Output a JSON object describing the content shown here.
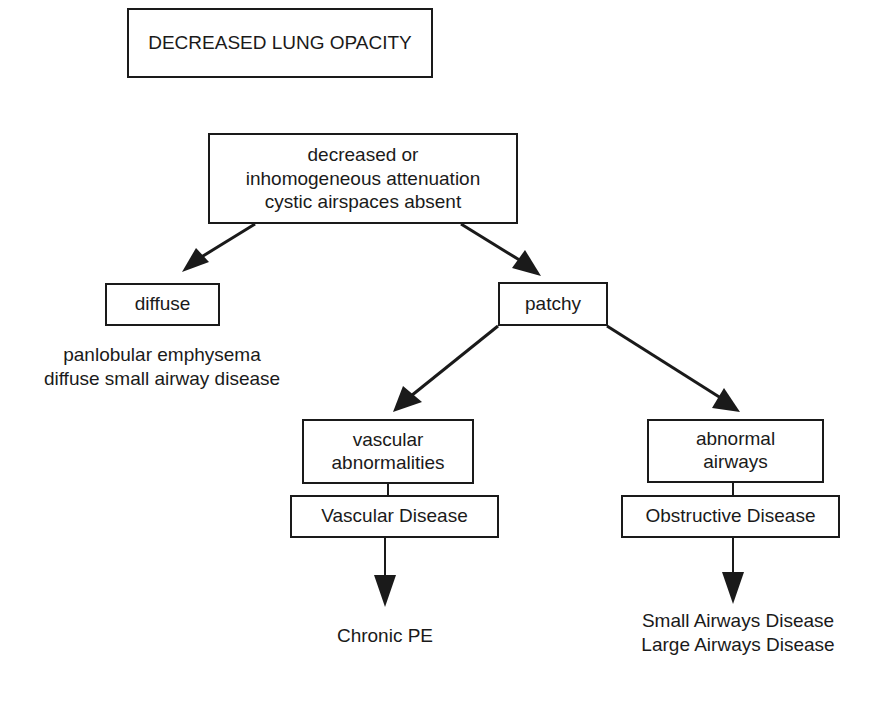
{
  "diagram": {
    "title": "DECREASED LUNG OPACITY",
    "root": {
      "lines": [
        "decreased or",
        "inhomogeneous attenuation",
        "cystic airspaces  absent"
      ]
    },
    "left_branch": {
      "label": "diffuse",
      "findings": [
        "panlobular emphysema",
        "diffuse small airway disease"
      ]
    },
    "right_branch": {
      "label": "patchy",
      "children": [
        {
          "lines": [
            "vascular",
            "abnormalities"
          ],
          "category": "Vascular Disease",
          "outcomes": [
            "Chronic PE"
          ]
        },
        {
          "lines": [
            "abnormal",
            "airways"
          ],
          "category": "Obstructive Disease",
          "outcomes": [
            "Small Airways Disease",
            "Large Airways Disease"
          ]
        }
      ]
    },
    "colors": {
      "ink": "#1a1a1a",
      "background": "#ffffff"
    }
  }
}
